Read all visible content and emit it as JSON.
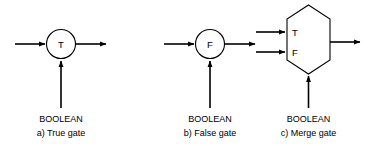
{
  "figure": {
    "background_color": "#ffffff",
    "line_color": "#000000",
    "gates": [
      {
        "id": "true-gate",
        "shape": "circle",
        "symbol": "T",
        "input_label": "BOOLEAN",
        "caption": "a)  True gate",
        "caption_index": "a)",
        "caption_name": "True gate",
        "ports": {
          "data_in": "left",
          "data_out": "right",
          "control_in": "bottom"
        }
      },
      {
        "id": "false-gate",
        "shape": "circle",
        "symbol": "F",
        "input_label": "BOOLEAN",
        "caption": "b)  False gate",
        "caption_index": "b)",
        "caption_name": "False gate",
        "ports": {
          "data_in": "left",
          "data_out": "right",
          "control_in": "bottom"
        }
      },
      {
        "id": "merge-gate",
        "shape": "hexagon",
        "symbol_top": "T",
        "symbol_bottom": "F",
        "input_label": "BOOLEAN",
        "caption": "c)  Merge gate",
        "caption_index": "c)",
        "caption_name": "Merge gate",
        "ports": {
          "data_in_true": "left-upper",
          "data_in_false": "left-lower",
          "data_out": "right",
          "control_in": "bottom"
        }
      }
    ]
  }
}
